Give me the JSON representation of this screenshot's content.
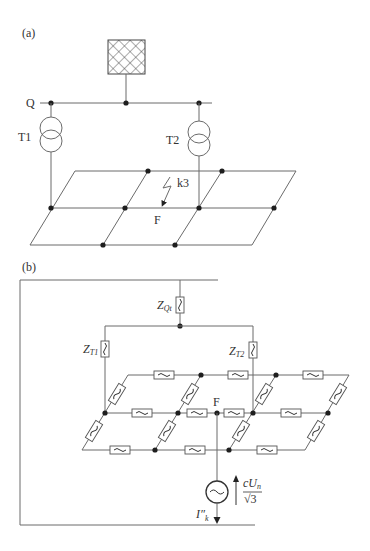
{
  "figure": {
    "panel_a": {
      "label": "(a)",
      "bus_label": "Q",
      "transformers": [
        {
          "label": "T1"
        },
        {
          "label": "T2"
        }
      ],
      "fault_label": "k3",
      "fault_point_label": "F",
      "source_icon": "hatched-network-feeder-icon"
    },
    "panel_b": {
      "label": "(b)",
      "impedances": {
        "zqt": {
          "main": "Z",
          "sub": "Qt"
        },
        "zt1": {
          "main": "Z",
          "sub": "T1"
        },
        "zt2": {
          "main": "Z",
          "sub": "T2"
        }
      },
      "fault_point_label": "F",
      "source": {
        "voltage_numerator": "cU",
        "voltage_numerator_sub": "n",
        "voltage_denominator": "√3",
        "current_main": "I″",
        "current_sub": "k",
        "icon": "ac-voltage-source-icon"
      },
      "line_impedance_symbol": "~"
    }
  }
}
